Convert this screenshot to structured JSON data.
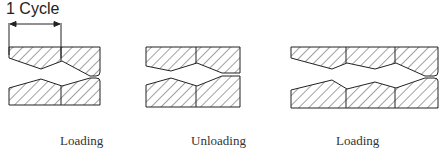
{
  "figure": {
    "annotation": "1 Cycle",
    "panels": [
      {
        "caption": "Loading",
        "state": "crack-tip-blunted-open"
      },
      {
        "caption": "Unloading",
        "state": "crack-tip-closed-sharp"
      },
      {
        "caption": "Loading",
        "state": "crack-advanced-one-cycle-blunted"
      }
    ],
    "colors": {
      "line": "#222222",
      "hatch": "#444444",
      "text": "#333333"
    }
  }
}
